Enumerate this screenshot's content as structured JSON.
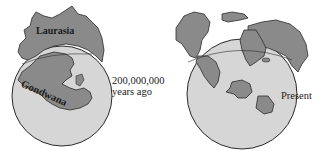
{
  "figure": {
    "panels": [
      {
        "id": "past",
        "labels": {
          "northern_continent": "Laurasia",
          "southern_continent": "Gondwana"
        },
        "caption_line1": "200,000,000",
        "caption_line2": "years ago"
      },
      {
        "id": "present",
        "caption": "Present"
      }
    ],
    "colors": {
      "globe_fill": "#d6d6d6",
      "land_fill": "#8a8a8a",
      "outline": "#2b2b2b",
      "background": "#ffffff"
    }
  }
}
